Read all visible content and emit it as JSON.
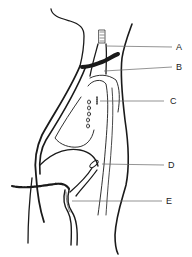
{
  "diagram": {
    "type": "anatomical line drawing (neck/chest sagittal view with tube)",
    "labels": [
      {
        "id": "A",
        "text": "A"
      },
      {
        "id": "B",
        "text": "B"
      },
      {
        "id": "C",
        "text": "C"
      },
      {
        "id": "D",
        "text": "D"
      },
      {
        "id": "E",
        "text": "E"
      }
    ],
    "colors": {
      "line": "#1a1a1a",
      "leader": "#666666",
      "background": "#ffffff"
    }
  }
}
